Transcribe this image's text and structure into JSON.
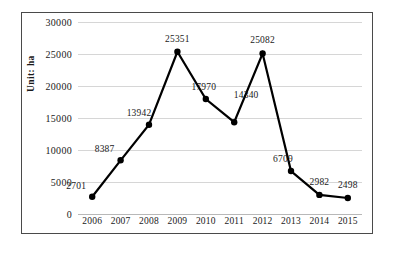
{
  "chart_data": {
    "type": "line",
    "title": "",
    "xlabel": "",
    "ylabel": "Unit: ha",
    "categories": [
      "2006",
      "2007",
      "2008",
      "2009",
      "2010",
      "2011",
      "2012",
      "2013",
      "2014",
      "2015"
    ],
    "values": [
      2701,
      8387,
      13942,
      25351,
      17970,
      14340,
      25082,
      6709,
      2982,
      2498
    ],
    "point_labels": [
      "2701",
      "8387",
      "13942",
      "25351",
      "17970",
      "14340",
      "25082",
      "6709",
      "2982",
      "2498"
    ],
    "ylim": [
      0,
      30000
    ],
    "ytick_values": [
      0,
      5000,
      10000,
      15000,
      20000,
      25000,
      30000
    ],
    "ytick_labels": [
      "0",
      "5000",
      "10000",
      "15000",
      "20000",
      "25000",
      "30000"
    ],
    "grid": true,
    "legend": "none",
    "series_color": "#000000",
    "grid_color": "#d6d6d6",
    "frame_color": "#4a4a4a",
    "background_color": "#ffffff",
    "marker": "filled-circle"
  }
}
